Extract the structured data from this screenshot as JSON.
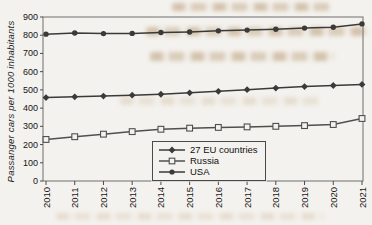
{
  "figure": {
    "background_color": "#f4f2ee",
    "artifact_note": "scanned page with faint ink bleed-through"
  },
  "chart_data": {
    "type": "line",
    "title": "",
    "xlabel": "",
    "ylabel": "Passanger cars per 1000 inhabitants",
    "x": [
      "2010",
      "2011",
      "2012",
      "2013",
      "2014",
      "2015",
      "2016",
      "2017",
      "2018",
      "2019",
      "2020",
      "2021"
    ],
    "ylim": [
      0,
      900
    ],
    "ytick_step": 100,
    "yticks": [
      0,
      100,
      200,
      300,
      400,
      500,
      600,
      700,
      800,
      900
    ],
    "grid": false,
    "frame": true,
    "legend_position": "inside-bottom-center",
    "line_color": "#3f3f3f",
    "series": [
      {
        "name": "27 EU countries",
        "marker": "diamond-filled",
        "color": "#3a3a3a",
        "values": [
          458,
          462,
          466,
          471,
          476,
          484,
          492,
          501,
          510,
          518,
          524,
          530
        ]
      },
      {
        "name": "Russia",
        "marker": "square-open",
        "color": "#4f4f4f",
        "values": [
          228,
          243,
          257,
          271,
          284,
          290,
          294,
          297,
          300,
          304,
          310,
          343
        ]
      },
      {
        "name": "USA",
        "marker": "circle-filled",
        "color": "#3a3a3a",
        "values": [
          806,
          812,
          809,
          810,
          815,
          818,
          824,
          828,
          833,
          839,
          844,
          862
        ]
      }
    ]
  }
}
